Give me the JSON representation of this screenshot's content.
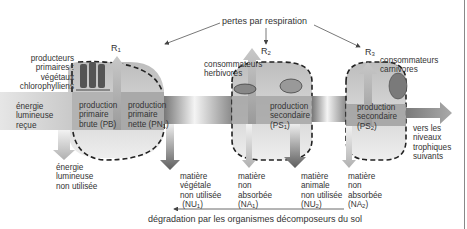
{
  "title": "pertes par respiration",
  "bottom_caption": "dégradation par les organismes décomposeurs du sol",
  "respiration": [
    {
      "label": "R",
      "sub": "1"
    },
    {
      "label": "R",
      "sub": "2"
    },
    {
      "label": "R",
      "sub": "3"
    }
  ],
  "levels": {
    "producers": {
      "name_lines": [
        "producteurs",
        "primaires :",
        "végétaux",
        "chlorophylliens"
      ],
      "gross": [
        "production",
        "primaire",
        "brute (PB)"
      ],
      "net": [
        "production",
        "primaire",
        "nette (PN",
        "1",
        ")"
      ]
    },
    "herbivores": {
      "name_lines": [
        "consommateurs",
        "herbivores"
      ],
      "production": [
        "production",
        "secondaire",
        "(PS",
        "1",
        ")"
      ]
    },
    "carnivores": {
      "name_lines": [
        "consommateurs",
        "carnivores"
      ],
      "production": [
        "production",
        "secondaire",
        "(PS",
        "2",
        ")"
      ]
    }
  },
  "input_energy": [
    "énergie",
    "lumineuse",
    "reçue"
  ],
  "unused_energy": [
    "énergie",
    "lumineuse",
    "non utilisée"
  ],
  "next_levels": [
    "vers les",
    "niveaux",
    "trophiques",
    "suivants"
  ],
  "losses": [
    {
      "lines": [
        "matière",
        "végétale",
        "non utilisée"
      ],
      "code": "NU",
      "sub": "1"
    },
    {
      "lines": [
        "matière",
        "non",
        "absorbée"
      ],
      "code": "NA",
      "sub": "1"
    },
    {
      "lines": [
        "matière",
        "animale",
        "non utilisée"
      ],
      "code": "NU",
      "sub": "2"
    },
    {
      "lines": [
        "matière",
        "non",
        "absorbée"
      ],
      "code": "NA",
      "sub": "2"
    }
  ],
  "colors": {
    "band_dark": "#8a8a8a",
    "band_light": "#e8e8e8",
    "blob_fill": "#d4d4d4",
    "arrow_dark": "#6e6e6e",
    "arrow_light": "#bdbdbd",
    "text": "#333333"
  }
}
